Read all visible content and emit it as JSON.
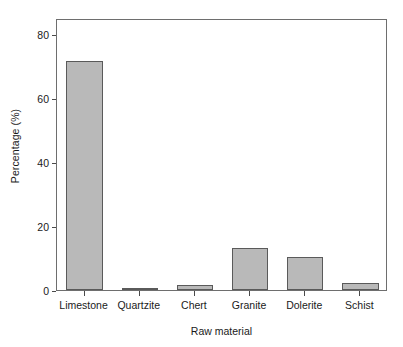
{
  "chart_data": {
    "type": "bar",
    "title": "",
    "xlabel": "Raw material",
    "ylabel": "Percentage (%)",
    "categories": [
      "Limestone",
      "Quartzite",
      "Chert",
      "Granite",
      "Dolerite",
      "Schist"
    ],
    "values": [
      71.5,
      0.4,
      1.6,
      13.2,
      10.4,
      2.2
    ],
    "ylim": [
      0,
      85
    ],
    "yticks": [
      0,
      20,
      40,
      60,
      80
    ],
    "ytick_labels": [
      "0",
      "20",
      "40",
      "60",
      "80"
    ],
    "grid": false,
    "legend": null,
    "bar_fill_color": "#b9b9b9",
    "bar_edge_color": "#5a5a5a",
    "axis_color": "#6e6e6e",
    "background_color": "#ffffff"
  }
}
